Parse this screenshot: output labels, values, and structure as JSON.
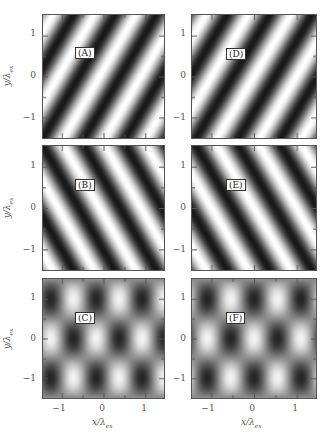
{
  "chart_data": {
    "type": "heatmap",
    "title": "",
    "xlabel": "x/λ_ex",
    "ylabel": "y/λ_ex",
    "xlim": [
      -1.45,
      1.45
    ],
    "ylim": [
      -1.5,
      1.5
    ],
    "xticks": [
      -1,
      0,
      1
    ],
    "yticks": [
      -1,
      0,
      1
    ],
    "colormap": "grayscale (black = low, white = high)",
    "layout": {
      "rows": 3,
      "cols": 2
    },
    "panels": [
      {
        "label": "(A)",
        "pattern": "stripes",
        "description": "tilted fringes running lower-left to upper-right",
        "kx": 6.28,
        "ky": -3.6,
        "phase": 0.6
      },
      {
        "label": "(B)",
        "pattern": "stripes",
        "description": "tilted fringes running upper-left to lower-right",
        "kx": 6.28,
        "ky": 3.6,
        "phase": 0.6
      },
      {
        "label": "(C)",
        "pattern": "lattice",
        "description": "rectangular lattice of bright/dark spots, alternating between rows",
        "kx": 5.7,
        "ky": 3.14,
        "phase": 1.0
      },
      {
        "label": "(D)",
        "pattern": "stripes",
        "description": "tilted fringes running lower-left to upper-right",
        "kx": 6.28,
        "ky": -3.6,
        "phase": 0.0
      },
      {
        "label": "(E)",
        "pattern": "stripes",
        "description": "tilted fringes running upper-left to lower-right",
        "kx": 6.28,
        "ky": 3.6,
        "phase": 0.0
      },
      {
        "label": "(F)",
        "pattern": "lattice",
        "description": "rectangular lattice of bright/dark spots, alternating between rows",
        "kx": 5.7,
        "ky": 3.14,
        "phase": 0.0
      }
    ]
  },
  "axes": {
    "y_tick_labels": [
      "1",
      "0",
      "−1"
    ],
    "x_tick_labels": [
      "−1",
      "0",
      "1"
    ],
    "x_title": "x/λ",
    "x_title_sub": "ex",
    "y_title": "y/λ",
    "y_title_sub": "ex"
  }
}
